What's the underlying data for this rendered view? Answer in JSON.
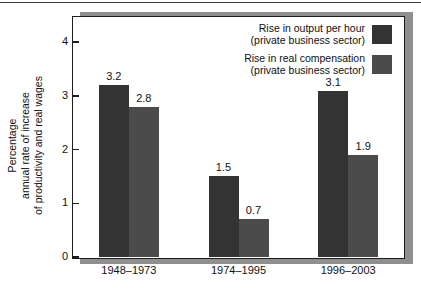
{
  "chart_data": {
    "type": "bar",
    "title": "",
    "xlabel": "",
    "ylabel": "Percentage annual rate of increase of productivity and real wages",
    "ylabel_lines": [
      "Percentage",
      "annual rate of increase",
      "of productivity and real wages"
    ],
    "categories": [
      "1948–1973",
      "1974–1995",
      "1996–2003"
    ],
    "series": [
      {
        "name": "Rise in output per hour (private business sector)",
        "name_lines": [
          "Rise in output per hour",
          "(private business sector)"
        ],
        "color": "#333333",
        "values": [
          3.2,
          2.8,
          3.1
        ]
      },
      {
        "name": "Rise in real compensation (private business sector)",
        "name_lines": [
          "Rise in real compensation",
          "(private business sector)"
        ],
        "color": "#4b4b4b",
        "values": [
          2.8,
          0.7,
          1.9
        ]
      }
    ],
    "bars": [
      {
        "category": "1948–1973",
        "series": 0,
        "value": 3.2,
        "label": "3.2"
      },
      {
        "category": "1948–1973",
        "series": 1,
        "value": 2.8,
        "label": "2.8"
      },
      {
        "category": "1974–1995",
        "series": 0,
        "value": 1.5,
        "label": "1.5"
      },
      {
        "category": "1974–1995",
        "series": 1,
        "value": 0.7,
        "label": "0.7"
      },
      {
        "category": "1996–2003",
        "series": 0,
        "value": 3.1,
        "label": "3.1"
      },
      {
        "category": "1996–2003",
        "series": 1,
        "value": 1.9,
        "label": "1.9"
      }
    ],
    "ylim": [
      0,
      4.45
    ],
    "yticks": [
      0,
      1,
      2,
      3,
      4
    ],
    "ytick_labels": [
      "0",
      "1",
      "2",
      "3",
      "4"
    ],
    "grid": false,
    "legend_position": "top-right"
  },
  "axis": {
    "y_title_line1": "Percentage",
    "y_title_line2": "annual rate of increase",
    "y_title_line3": "of productivity and real wages"
  },
  "legend": {
    "items": [
      {
        "line1": "Rise in output per hour",
        "line2": "(private business sector)",
        "color": "#333333"
      },
      {
        "line1": "Rise in real compensation",
        "line2": "(private business sector)",
        "color": "#4b4b4b"
      }
    ]
  }
}
